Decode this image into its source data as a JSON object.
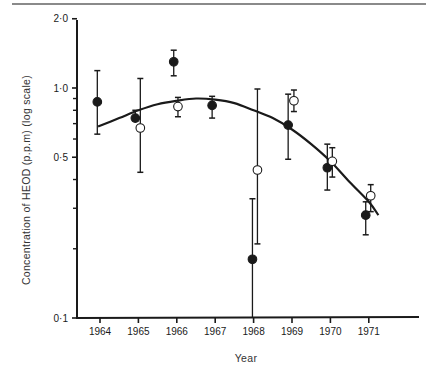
{
  "chart_data": {
    "type": "scatter",
    "title": "",
    "xlabel": "Year",
    "ylabel": "Concentration of HEOD (p.p.m) (log scale)",
    "yscale": "log",
    "ylim": [
      0.1,
      2.0
    ],
    "xlim": [
      1963.6,
      1972.3
    ],
    "y_ticks": [
      {
        "value": 2.0,
        "label": "2·0"
      },
      {
        "value": 1.0,
        "label": "1·0"
      },
      {
        "value": 0.5,
        "label": "0·5"
      },
      {
        "value": 0.1,
        "label": "0·1"
      }
    ],
    "y_minor_ticks": [
      0.9,
      0.8,
      0.7,
      0.6,
      0.4,
      0.3,
      0.2
    ],
    "x_ticks": [
      {
        "value": 1964,
        "label": "1964"
      },
      {
        "value": 1965,
        "label": "1965"
      },
      {
        "value": 1966,
        "label": "1966"
      },
      {
        "value": 1967,
        "label": "1967"
      },
      {
        "value": 1968,
        "label": "1968"
      },
      {
        "value": 1969,
        "label": "1969"
      },
      {
        "value": 1970,
        "label": "1970"
      },
      {
        "value": 1971,
        "label": "1971"
      }
    ],
    "grid": false,
    "legend": null,
    "series": [
      {
        "name": "filled circles",
        "marker": "filled-circle",
        "points": [
          {
            "x": 1963.93,
            "y": 0.87,
            "err_low": 0.63,
            "err_high": 1.19
          },
          {
            "x": 1964.92,
            "y": 0.74,
            "err_low": 0.72,
            "err_high": 0.8
          },
          {
            "x": 1965.92,
            "y": 1.3,
            "err_low": 1.13,
            "err_high": 1.46
          },
          {
            "x": 1966.92,
            "y": 0.84,
            "err_low": 0.74,
            "err_high": 0.92
          },
          {
            "x": 1967.97,
            "y": 0.18,
            "err_low": 0.1,
            "err_high": 0.33
          },
          {
            "x": 1968.9,
            "y": 0.69,
            "err_low": 0.49,
            "err_high": 0.94
          },
          {
            "x": 1969.92,
            "y": 0.45,
            "err_low": 0.36,
            "err_high": 0.57
          },
          {
            "x": 1970.92,
            "y": 0.28,
            "err_low": 0.23,
            "err_high": 0.32
          }
        ]
      },
      {
        "name": "open circles",
        "marker": "open-circle",
        "points": [
          {
            "x": 1965.05,
            "y": 0.67,
            "err_low": 0.43,
            "err_high": 1.1
          },
          {
            "x": 1966.03,
            "y": 0.83,
            "err_low": 0.75,
            "err_high": 0.91
          },
          {
            "x": 1968.1,
            "y": 0.44,
            "err_low": 0.21,
            "err_high": 0.99
          },
          {
            "x": 1969.05,
            "y": 0.88,
            "err_low": 0.79,
            "err_high": 0.98
          },
          {
            "x": 1970.05,
            "y": 0.48,
            "err_low": 0.41,
            "err_high": 0.55
          },
          {
            "x": 1971.05,
            "y": 0.34,
            "err_low": 0.29,
            "err_high": 0.38
          }
        ]
      }
    ],
    "fit_curve": {
      "name": "fitted curve",
      "points": [
        {
          "x": 1963.95,
          "y": 0.68
        },
        {
          "x": 1964.5,
          "y": 0.74
        },
        {
          "x": 1965.0,
          "y": 0.8
        },
        {
          "x": 1965.5,
          "y": 0.85
        },
        {
          "x": 1966.0,
          "y": 0.88
        },
        {
          "x": 1966.5,
          "y": 0.9
        },
        {
          "x": 1967.0,
          "y": 0.89
        },
        {
          "x": 1967.5,
          "y": 0.86
        },
        {
          "x": 1968.0,
          "y": 0.8
        },
        {
          "x": 1968.5,
          "y": 0.74
        },
        {
          "x": 1969.0,
          "y": 0.66
        },
        {
          "x": 1969.5,
          "y": 0.57
        },
        {
          "x": 1970.0,
          "y": 0.48
        },
        {
          "x": 1970.5,
          "y": 0.39
        },
        {
          "x": 1971.0,
          "y": 0.32
        },
        {
          "x": 1971.25,
          "y": 0.28
        }
      ]
    }
  }
}
